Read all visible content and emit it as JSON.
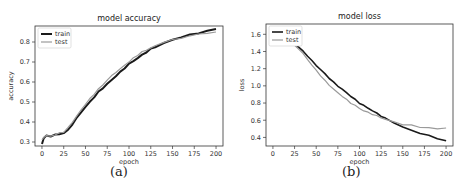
{
  "chart_data": [
    {
      "type": "line",
      "title": "model accuracy",
      "xlabel": "epoch",
      "ylabel": "accuracy",
      "caption": "(a)",
      "xlim": [
        -8,
        208
      ],
      "ylim": [
        0.28,
        0.88
      ],
      "xticks": [
        0,
        25,
        50,
        75,
        100,
        125,
        150,
        175,
        200
      ],
      "yticks": [
        0.3,
        0.4,
        0.5,
        0.6,
        0.7,
        0.8
      ],
      "ytick_labels": [
        "0.3",
        "0.4",
        "0.5",
        "0.6",
        "0.7",
        "0.8"
      ],
      "grid": false,
      "legend": {
        "position": "upper left",
        "entries": [
          "train",
          "test"
        ]
      },
      "series": [
        {
          "name": "train",
          "color": "#1a1a1a",
          "linewidth": 2,
          "x": [
            0,
            2,
            5,
            10,
            15,
            20,
            25,
            30,
            35,
            40,
            45,
            50,
            55,
            60,
            65,
            70,
            75,
            80,
            85,
            90,
            95,
            100,
            105,
            110,
            115,
            120,
            125,
            130,
            140,
            150,
            160,
            170,
            180,
            190,
            200
          ],
          "values": [
            0.29,
            0.32,
            0.33,
            0.33,
            0.335,
            0.34,
            0.345,
            0.36,
            0.39,
            0.42,
            0.45,
            0.475,
            0.5,
            0.525,
            0.55,
            0.57,
            0.59,
            0.61,
            0.63,
            0.65,
            0.67,
            0.69,
            0.705,
            0.72,
            0.735,
            0.75,
            0.765,
            0.775,
            0.795,
            0.81,
            0.825,
            0.835,
            0.845,
            0.855,
            0.865
          ]
        },
        {
          "name": "test",
          "color": "#9a9a9a",
          "linewidth": 1.2,
          "x": [
            0,
            2,
            5,
            10,
            15,
            20,
            25,
            30,
            35,
            40,
            45,
            50,
            55,
            60,
            65,
            70,
            75,
            80,
            85,
            90,
            95,
            100,
            105,
            110,
            115,
            120,
            125,
            130,
            140,
            150,
            160,
            170,
            180,
            190,
            200
          ],
          "values": [
            0.31,
            0.325,
            0.33,
            0.33,
            0.335,
            0.345,
            0.35,
            0.37,
            0.4,
            0.43,
            0.46,
            0.49,
            0.515,
            0.54,
            0.565,
            0.585,
            0.61,
            0.63,
            0.65,
            0.665,
            0.685,
            0.7,
            0.72,
            0.735,
            0.75,
            0.76,
            0.77,
            0.78,
            0.8,
            0.81,
            0.82,
            0.83,
            0.84,
            0.845,
            0.85
          ]
        }
      ]
    },
    {
      "type": "line",
      "title": "model loss",
      "xlabel": "epoch",
      "ylabel": "loss",
      "caption": "(b)",
      "xlim": [
        -8,
        208
      ],
      "ylim": [
        0.3,
        1.72
      ],
      "xticks": [
        0,
        25,
        50,
        75,
        100,
        125,
        150,
        175,
        200
      ],
      "yticks": [
        0.4,
        0.6,
        0.8,
        1.0,
        1.2,
        1.4,
        1.6
      ],
      "ytick_labels": [
        "0.4",
        "0.6",
        "0.8",
        "1.0",
        "1.2",
        "1.4",
        "1.6"
      ],
      "grid": false,
      "legend": {
        "position": "upper left",
        "entries": [
          "train",
          "test"
        ]
      },
      "series": [
        {
          "name": "train",
          "color": "#1a1a1a",
          "linewidth": 1.6,
          "x": [
            0,
            5,
            10,
            15,
            20,
            25,
            30,
            35,
            40,
            45,
            50,
            55,
            60,
            65,
            70,
            75,
            80,
            85,
            90,
            95,
            100,
            105,
            110,
            115,
            120,
            125,
            130,
            140,
            150,
            160,
            170,
            180,
            190,
            200
          ],
          "values": [
            1.6,
            1.56,
            1.54,
            1.52,
            1.5,
            1.48,
            1.45,
            1.4,
            1.35,
            1.29,
            1.24,
            1.19,
            1.14,
            1.09,
            1.04,
            1.0,
            0.96,
            0.92,
            0.88,
            0.84,
            0.8,
            0.77,
            0.74,
            0.71,
            0.68,
            0.65,
            0.62,
            0.57,
            0.52,
            0.48,
            0.45,
            0.42,
            0.39,
            0.36
          ]
        },
        {
          "name": "test",
          "color": "#9a9a9a",
          "linewidth": 1.2,
          "x": [
            0,
            5,
            10,
            15,
            20,
            25,
            30,
            35,
            40,
            45,
            50,
            55,
            60,
            65,
            70,
            75,
            80,
            85,
            90,
            95,
            100,
            105,
            110,
            115,
            120,
            125,
            130,
            140,
            150,
            160,
            170,
            180,
            190,
            200
          ],
          "values": [
            1.58,
            1.55,
            1.53,
            1.51,
            1.49,
            1.47,
            1.43,
            1.37,
            1.31,
            1.24,
            1.18,
            1.12,
            1.06,
            1.01,
            0.96,
            0.92,
            0.88,
            0.84,
            0.8,
            0.77,
            0.74,
            0.71,
            0.69,
            0.67,
            0.65,
            0.63,
            0.61,
            0.58,
            0.55,
            0.54,
            0.52,
            0.51,
            0.5,
            0.51
          ]
        }
      ]
    }
  ]
}
